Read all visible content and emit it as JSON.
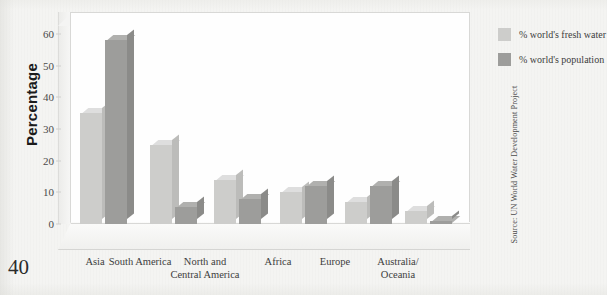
{
  "page": {
    "number": "40"
  },
  "chart_data": {
    "type": "bar",
    "title": "",
    "xlabel": "",
    "ylabel": "Percentage",
    "ylim": [
      0,
      60
    ],
    "yticks": [
      0,
      10,
      20,
      30,
      40,
      50,
      60
    ],
    "ytick_labels": [
      "0",
      "10",
      "20",
      "30",
      "40",
      "50",
      "60"
    ],
    "grid": false,
    "legend_position": "right",
    "style": "3d-grouped-columns",
    "categories": [
      "Asia",
      "South America",
      "North and\nCentral America",
      "Africa",
      "Europe",
      "Australia/\nOceania"
    ],
    "series": [
      {
        "name": "% world's fresh water",
        "color": "#cdcdcb",
        "values": [
          35,
          25,
          14,
          10,
          7,
          4
        ]
      },
      {
        "name": "% world's population",
        "color": "#9d9d9b",
        "values": [
          58,
          5.5,
          8,
          12,
          12,
          1
        ]
      }
    ],
    "source": "Source: UN World Water Development Project"
  }
}
